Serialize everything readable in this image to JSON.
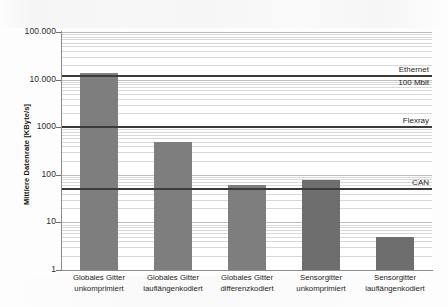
{
  "chart_data": {
    "type": "bar",
    "title": "",
    "xlabel": "",
    "ylabel": "Mittlere Datenrate [KByte/s]",
    "yscale": "log",
    "ylim": [
      1,
      100000
    ],
    "ytick_labels": [
      "100.000",
      "10.000",
      "1000",
      "100",
      "10",
      "1"
    ],
    "ytick_values": [
      100000,
      10000,
      1000,
      100,
      10,
      1
    ],
    "grid": true,
    "legend": "none",
    "categories": [
      "Globales Gitter unkomprimiert",
      "Globales Gitter lauflängenkodiert",
      "Globales Gitter differenzkodiert",
      "Sensorgitter unkomprimiert",
      "Sensorgitter lauflängenkodiert"
    ],
    "category_lines": [
      [
        "Globales Gitter",
        "unkomprimiert"
      ],
      [
        "Globales Gitter",
        "lauflängenkodiert"
      ],
      [
        "Globales Gitter",
        "differenzkodiert"
      ],
      [
        "Sensorgitter",
        "unkomprimiert"
      ],
      [
        "Sensorgitter",
        "lauflängenkodiert"
      ]
    ],
    "values": [
      14000,
      480,
      62,
      78,
      5
    ],
    "bar_color": "#7e7e7e",
    "reference_lines": [
      {
        "label_line1": "Ethernet",
        "label_line2": "100 Mbit",
        "value": 12000,
        "color": "#3b3b3b"
      },
      {
        "label_line1": "Flexray",
        "label_line2": "",
        "value": 1000,
        "color": "#3b3b3b"
      },
      {
        "label_line1": "CAN",
        "label_line2": "",
        "value": 50,
        "color": "#3b3b3b"
      }
    ]
  }
}
